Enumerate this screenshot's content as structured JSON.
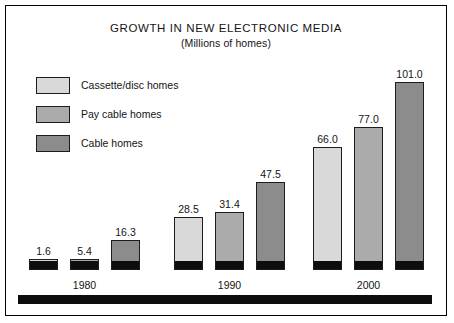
{
  "chart_data": {
    "type": "bar",
    "title": "GROWTH IN NEW ELECTRONIC MEDIA",
    "subtitle": "(Millions of homes)",
    "xlabel": "",
    "ylabel": "Millions of homes",
    "ylim": [
      0,
      101.0
    ],
    "grid": false,
    "legend_position": "top-left",
    "categories": [
      "1980",
      "1990",
      "2000"
    ],
    "series": [
      {
        "name": "Cassette/disc homes",
        "color": "#d9d9d9",
        "values": [
          1.6,
          28.5,
          66.0
        ],
        "labels": [
          "1.6",
          "28.5",
          "66.0"
        ]
      },
      {
        "name": "Pay cable homes",
        "color": "#ababab",
        "values": [
          5.4,
          31.4,
          77.0
        ],
        "labels": [
          "5.4",
          "31.4",
          "77.0"
        ]
      },
      {
        "name": "Cable homes",
        "color": "#8c8c8c",
        "values": [
          16.3,
          47.5,
          101.0
        ],
        "labels": [
          "16.3",
          "47.5",
          "101.0"
        ]
      }
    ]
  },
  "legend": {
    "items": [
      {
        "label": "Cassette/disc homes",
        "color": "#d9d9d9"
      },
      {
        "label": "Pay cable homes",
        "color": "#ababab"
      },
      {
        "label": "Cable homes",
        "color": "#8c8c8c"
      }
    ]
  },
  "colors": {
    "frame": "#000000",
    "base_block": "#0d0d0d",
    "bar_outline": "#1c1c1c",
    "text": "#141414",
    "background": "#ffffff"
  }
}
